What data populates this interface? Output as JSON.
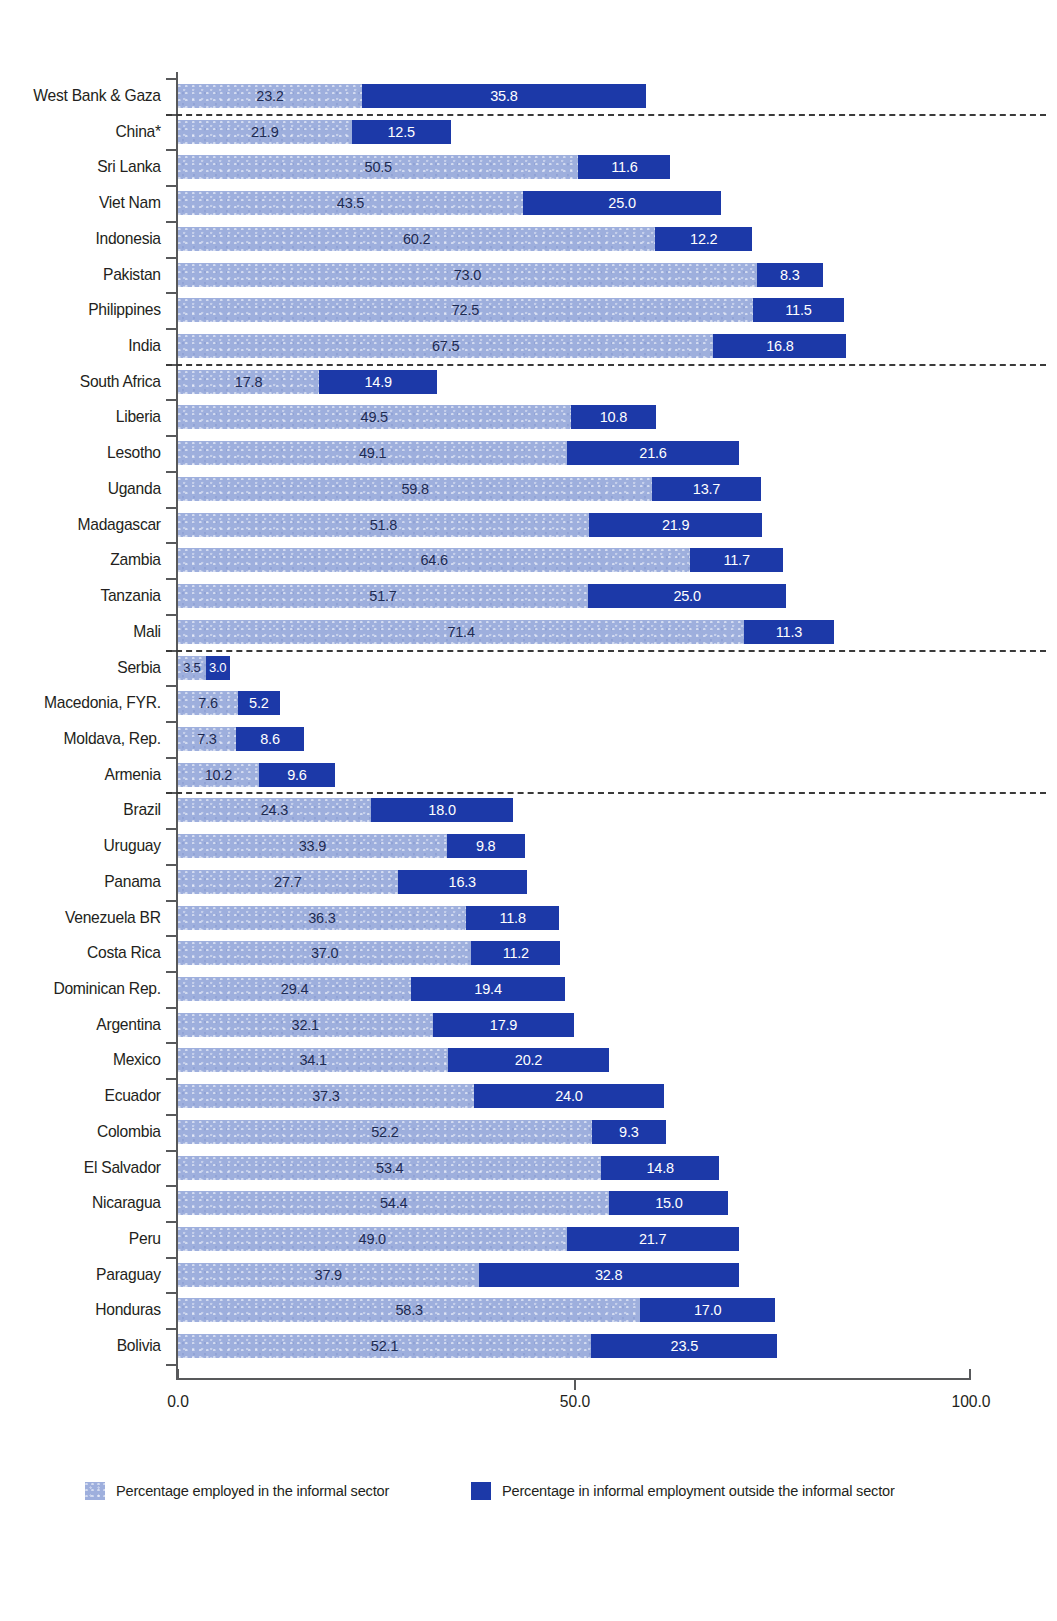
{
  "chart_data": {
    "type": "bar",
    "subtype": "horizontal-stacked",
    "title": "",
    "xlabel": "",
    "ylabel": "",
    "xlim": [
      0,
      100
    ],
    "xticks": [
      "0.0",
      "50.0",
      "100.0"
    ],
    "xtick_values": [
      0,
      50,
      100
    ],
    "grid": false,
    "legend_position": "bottom",
    "series": [
      {
        "name": "Percentage employed in the informal sector",
        "color": "#9eafdd"
      },
      {
        "name": "Percentage in informal employment outside the informal sector",
        "color": "#1c39a8"
      }
    ],
    "categories": [
      "West Bank & Gaza",
      "China*",
      "Sri Lanka",
      "Viet Nam",
      "Indonesia",
      "Pakistan",
      "Philippines",
      "India",
      "South Africa",
      "Liberia",
      "Lesotho",
      "Uganda",
      "Madagascar",
      "Zambia",
      "Tanzania",
      "Mali",
      "Serbia",
      "Macedonia, FYR.",
      "Moldava, Rep.",
      "Armenia",
      "Brazil",
      "Uruguay",
      "Panama",
      "Venezuela BR",
      "Costa Rica",
      "Dominican Rep.",
      "Argentina",
      "Mexico",
      "Ecuador",
      "Colombia",
      "El Salvador",
      "Nicaragua",
      "Peru",
      "Paraguay",
      "Honduras",
      "Bolivia"
    ],
    "rows": [
      {
        "label": "West Bank & Gaza",
        "informal": 23.2,
        "outside": 35.8,
        "informal_text": "23.2",
        "outside_text": "35.8"
      },
      {
        "label": "China*",
        "informal": 21.9,
        "outside": 12.5,
        "informal_text": "21.9",
        "outside_text": "12.5"
      },
      {
        "label": "Sri Lanka",
        "informal": 50.5,
        "outside": 11.6,
        "informal_text": "50.5",
        "outside_text": "11.6"
      },
      {
        "label": "Viet Nam",
        "informal": 43.5,
        "outside": 25.0,
        "informal_text": "43.5",
        "outside_text": "25.0"
      },
      {
        "label": "Indonesia",
        "informal": 60.2,
        "outside": 12.2,
        "informal_text": "60.2",
        "outside_text": "12.2"
      },
      {
        "label": "Pakistan",
        "informal": 73.0,
        "outside": 8.3,
        "informal_text": "73.0",
        "outside_text": "8.3"
      },
      {
        "label": "Philippines",
        "informal": 72.5,
        "outside": 11.5,
        "informal_text": "72.5",
        "outside_text": "11.5"
      },
      {
        "label": "India",
        "informal": 67.5,
        "outside": 16.8,
        "informal_text": "67.5",
        "outside_text": "16.8"
      },
      {
        "label": "South Africa",
        "informal": 17.8,
        "outside": 14.9,
        "informal_text": "17.8",
        "outside_text": "14.9"
      },
      {
        "label": "Liberia",
        "informal": 49.5,
        "outside": 10.8,
        "informal_text": "49.5",
        "outside_text": "10.8"
      },
      {
        "label": "Lesotho",
        "informal": 49.1,
        "outside": 21.6,
        "informal_text": "49.1",
        "outside_text": "21.6"
      },
      {
        "label": "Uganda",
        "informal": 59.8,
        "outside": 13.7,
        "informal_text": "59.8",
        "outside_text": "13.7"
      },
      {
        "label": "Madagascar",
        "informal": 51.8,
        "outside": 21.9,
        "informal_text": "51.8",
        "outside_text": "21.9"
      },
      {
        "label": "Zambia",
        "informal": 64.6,
        "outside": 11.7,
        "informal_text": "64.6",
        "outside_text": "11.7"
      },
      {
        "label": "Tanzania",
        "informal": 51.7,
        "outside": 25.0,
        "informal_text": "51.7",
        "outside_text": "25.0"
      },
      {
        "label": "Mali",
        "informal": 71.4,
        "outside": 11.3,
        "informal_text": "71.4",
        "outside_text": "11.3"
      },
      {
        "label": "Serbia",
        "informal": 3.5,
        "outside": 3.0,
        "informal_text": "3.5",
        "outside_text": "3.0"
      },
      {
        "label": "Macedonia, FYR.",
        "informal": 7.6,
        "outside": 5.2,
        "informal_text": "7.6",
        "outside_text": "5.2"
      },
      {
        "label": "Moldava, Rep.",
        "informal": 7.3,
        "outside": 8.6,
        "informal_text": "7.3",
        "outside_text": "8.6"
      },
      {
        "label": "Armenia",
        "informal": 10.2,
        "outside": 9.6,
        "informal_text": "10.2",
        "outside_text": "9.6"
      },
      {
        "label": "Brazil",
        "informal": 24.3,
        "outside": 18.0,
        "informal_text": "24.3",
        "outside_text": "18.0"
      },
      {
        "label": "Uruguay",
        "informal": 33.9,
        "outside": 9.8,
        "informal_text": "33.9",
        "outside_text": "9.8"
      },
      {
        "label": "Panama",
        "informal": 27.7,
        "outside": 16.3,
        "informal_text": "27.7",
        "outside_text": "16.3"
      },
      {
        "label": "Venezuela BR",
        "informal": 36.3,
        "outside": 11.8,
        "informal_text": "36.3",
        "outside_text": "11.8"
      },
      {
        "label": "Costa Rica",
        "informal": 37.0,
        "outside": 11.2,
        "informal_text": "37.0",
        "outside_text": "11.2"
      },
      {
        "label": "Dominican Rep.",
        "informal": 29.4,
        "outside": 19.4,
        "informal_text": "29.4",
        "outside_text": "19.4"
      },
      {
        "label": "Argentina",
        "informal": 32.1,
        "outside": 17.9,
        "informal_text": "32.1",
        "outside_text": "17.9"
      },
      {
        "label": "Mexico",
        "informal": 34.1,
        "outside": 20.2,
        "informal_text": "34.1",
        "outside_text": "20.2"
      },
      {
        "label": "Ecuador",
        "informal": 37.3,
        "outside": 24.0,
        "informal_text": "37.3",
        "outside_text": "24.0"
      },
      {
        "label": "Colombia",
        "informal": 52.2,
        "outside": 9.3,
        "informal_text": "52.2",
        "outside_text": "9.3"
      },
      {
        "label": "El Salvador",
        "informal": 53.4,
        "outside": 14.8,
        "informal_text": "53.4",
        "outside_text": "14.8"
      },
      {
        "label": "Nicaragua",
        "informal": 54.4,
        "outside": 15.0,
        "informal_text": "54.4",
        "outside_text": "15.0"
      },
      {
        "label": "Peru",
        "informal": 49.0,
        "outside": 21.7,
        "informal_text": "49.0",
        "outside_text": "21.7"
      },
      {
        "label": "Paraguay",
        "informal": 37.9,
        "outside": 32.8,
        "informal_text": "37.9",
        "outside_text": "32.8"
      },
      {
        "label": "Honduras",
        "informal": 58.3,
        "outside": 17.0,
        "informal_text": "58.3",
        "outside_text": "17.0"
      },
      {
        "label": "Bolivia",
        "informal": 52.1,
        "outside": 23.5,
        "informal_text": "52.1",
        "outside_text": "23.5"
      }
    ],
    "group_separators_after": [
      0,
      7,
      15,
      19
    ]
  },
  "legend": {
    "items": [
      {
        "label": "Percentage employed in the informal sector",
        "color": "#9eafdd",
        "swatch": "informal"
      },
      {
        "label": "Percentage in informal employment outside the informal sector",
        "color": "#1c39a8",
        "swatch": "outside"
      }
    ]
  },
  "axis": {
    "tick_0": "0.0",
    "tick_50": "50.0",
    "tick_100": "100.0"
  }
}
